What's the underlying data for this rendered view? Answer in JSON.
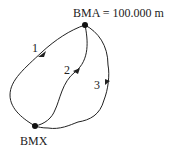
{
  "diagram": {
    "benchmarks": [
      {
        "id": "BMA",
        "label": "BMA = 100.000 m"
      },
      {
        "id": "BMX",
        "label": "BMX"
      }
    ],
    "routes": [
      {
        "label": "1",
        "from": "BMA",
        "to": "BMX"
      },
      {
        "label": "2",
        "from": "BMA",
        "to": "BMX"
      },
      {
        "label": "3",
        "from": "BMA",
        "to": "BMX"
      }
    ],
    "colors": {
      "line": "#222222",
      "text": "#222222",
      "background": "#ffffff"
    }
  }
}
